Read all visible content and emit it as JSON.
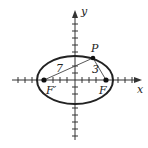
{
  "diagram": {
    "type": "ellipse-foci",
    "axes": {
      "x_label": "x",
      "y_label": "y"
    },
    "points": {
      "P": "P",
      "F": "F",
      "F_prime": "F′"
    },
    "segments": {
      "PF_prime_length": "7",
      "PF_length": "3"
    },
    "colors": {
      "stroke": "#222222",
      "background": "#ffffff"
    }
  }
}
